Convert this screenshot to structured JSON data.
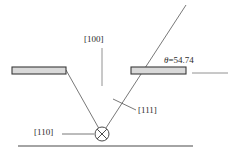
{
  "figure": {
    "labels": {
      "direction_100": "[100]",
      "direction_111": "[111]",
      "direction_110": "[110]",
      "angle_symbol": "θ",
      "angle_equals": "=",
      "angle_value": "54.74"
    },
    "colors": {
      "line": "#555555",
      "bar_fill": "#d9d9d9",
      "bar_stroke": "#3a3a3a",
      "text": "#2b2b2b",
      "baseline": "#4a4a4a"
    },
    "geometry": {
      "apex": {
        "x": 102,
        "y": 134
      },
      "circle_radius": 7,
      "left_bar": {
        "x": 12,
        "y": 67,
        "width": 54,
        "height": 7
      },
      "right_bar": {
        "x": 131,
        "y": 67,
        "width": 55,
        "height": 7
      },
      "baseline": {
        "x1": 18,
        "y1": 146,
        "x2": 193,
        "y2": 146
      },
      "normal_line": {
        "x1": 102,
        "y1": 48,
        "x2": 102,
        "y2": 86
      },
      "right_ray": {
        "x1": 102,
        "y1": 134,
        "x2": 186,
        "y2": 5
      },
      "left_ray": {
        "x1": 66,
        "y1": 70,
        "x2": 102,
        "y2": 134
      },
      "reference_line": {
        "x1": 192,
        "y1": 73,
        "x2": 228,
        "y2": 73
      },
      "leader_111": {
        "x1": 113,
        "y1": 99,
        "x2": 136,
        "y2": 110
      },
      "leader_110": {
        "x1": 62,
        "y1": 134,
        "x2": 94,
        "y2": 134
      }
    }
  }
}
